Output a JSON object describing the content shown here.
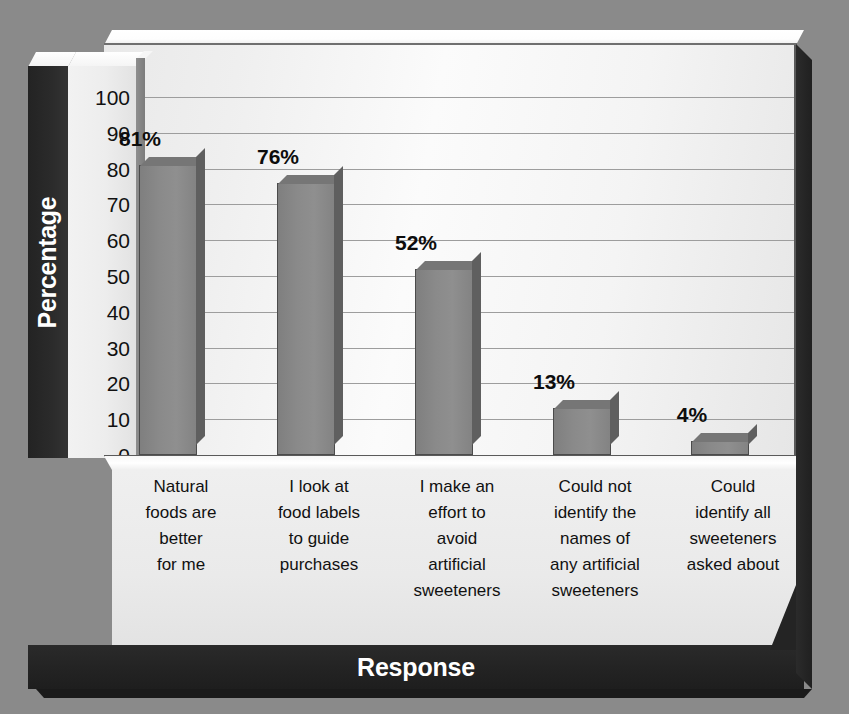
{
  "chart_data": {
    "type": "bar",
    "title": "",
    "xlabel": "Response",
    "ylabel": "Percentage",
    "ylim": [
      0,
      100
    ],
    "ytick_labels": [
      "100",
      "90",
      "80",
      "70",
      "60",
      "50",
      "40",
      "30",
      "20",
      "10",
      "0"
    ],
    "ytick_values": [
      100,
      90,
      80,
      70,
      60,
      50,
      40,
      30,
      20,
      10,
      0
    ],
    "grid": true,
    "legend": "none",
    "categories": [
      "Natural foods are better for me",
      "I look at food labels to guide purchases",
      "I make an effort to avoid artificial sweeteners",
      "Could not identify the names of any artificial sweeteners",
      "Could identify all sweeteners asked about"
    ],
    "category_lines": [
      [
        "Natural",
        "foods are",
        "better",
        "for me"
      ],
      [
        "I look at",
        "food labels",
        "to guide",
        "purchases"
      ],
      [
        "I make an",
        "effort to",
        "avoid",
        "artificial",
        "sweeteners"
      ],
      [
        "Could not",
        "identify the",
        "names of",
        "any artificial",
        "sweeteners"
      ],
      [
        "Could",
        "identify all",
        "sweeteners",
        "asked about"
      ]
    ],
    "values": [
      81,
      76,
      52,
      13,
      4
    ],
    "data_labels": [
      "81%",
      "76%",
      "52%",
      "13%",
      "4%"
    ],
    "colors": {
      "bar_face": "#888888",
      "bar_edge": "#4b4b4b",
      "bar_top": "#767676",
      "bar_side": "#5f5f5f",
      "plot_background": "#f6f6f6",
      "gridline": "#9d9d9d",
      "outer_background": "#8a8a8a",
      "axis_band": "#232323",
      "axis_band_text": "#ffffff",
      "tick_text": "#111111"
    }
  }
}
